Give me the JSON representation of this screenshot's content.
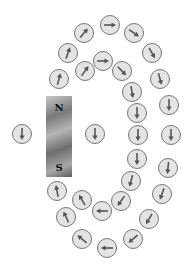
{
  "magnet": {
    "north_label": "N",
    "south_label": "S"
  },
  "colors": {
    "compass_fill": "#e4e4e4",
    "compass_stroke": "#777777",
    "needle": "#555555"
  },
  "compasses": [
    {
      "x": 110,
      "y": 25,
      "angle": 0
    },
    {
      "x": 84,
      "y": 33,
      "angle": -50
    },
    {
      "x": 134,
      "y": 33,
      "angle": 35
    },
    {
      "x": 68,
      "y": 53,
      "angle": -70
    },
    {
      "x": 152,
      "y": 53,
      "angle": 60
    },
    {
      "x": 103,
      "y": 61,
      "angle": 0
    },
    {
      "x": 85,
      "y": 71,
      "angle": -55
    },
    {
      "x": 122,
      "y": 71,
      "angle": 45
    },
    {
      "x": 59,
      "y": 79,
      "angle": -75
    },
    {
      "x": 160,
      "y": 79,
      "angle": 75
    },
    {
      "x": 132,
      "y": 92,
      "angle": 80
    },
    {
      "x": 169,
      "y": 105,
      "angle": 90
    },
    {
      "x": 137,
      "y": 113,
      "angle": 90
    },
    {
      "x": 22,
      "y": 134,
      "angle": 90
    },
    {
      "x": 95,
      "y": 134,
      "angle": 90
    },
    {
      "x": 138,
      "y": 135,
      "angle": 90
    },
    {
      "x": 171,
      "y": 135,
      "angle": 90
    },
    {
      "x": 137,
      "y": 159,
      "angle": 90
    },
    {
      "x": 168,
      "y": 168,
      "angle": 95
    },
    {
      "x": 131,
      "y": 181,
      "angle": 105
    },
    {
      "x": 57,
      "y": 191,
      "angle": -100
    },
    {
      "x": 162,
      "y": 194,
      "angle": 110
    },
    {
      "x": 82,
      "y": 200,
      "angle": -120
    },
    {
      "x": 121,
      "y": 201,
      "angle": 125
    },
    {
      "x": 102,
      "y": 211,
      "angle": 180
    },
    {
      "x": 66,
      "y": 217,
      "angle": -115
    },
    {
      "x": 149,
      "y": 219,
      "angle": 120
    },
    {
      "x": 82,
      "y": 239,
      "angle": -140
    },
    {
      "x": 133,
      "y": 239,
      "angle": 140
    },
    {
      "x": 107,
      "y": 248,
      "angle": 180
    }
  ]
}
